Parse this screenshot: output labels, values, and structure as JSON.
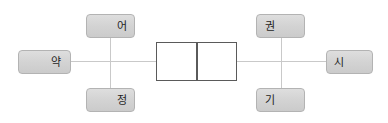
{
  "diagram": {
    "background_color": "#ffffff",
    "line_color": "#c9c9c9",
    "node_fill_color": "#d4d4d4",
    "node_border_color": "#b3b3b3",
    "center_border_color": "#5a5a5a",
    "center_fill_color": "#ffffff",
    "nodes": [
      {
        "id": "left",
        "label": "약",
        "position": "left"
      },
      {
        "id": "top-left",
        "label": "어",
        "position": "top-left"
      },
      {
        "id": "bottom-left",
        "label": "정",
        "position": "bottom-left"
      },
      {
        "id": "top-right",
        "label": "권",
        "position": "top-right"
      },
      {
        "id": "bottom-right",
        "label": "기",
        "position": "bottom-right"
      },
      {
        "id": "right",
        "label": "시",
        "position": "right"
      }
    ],
    "center_cells": [
      {
        "id": "center-cell-left",
        "label": ""
      },
      {
        "id": "center-cell-right",
        "label": ""
      }
    ]
  }
}
